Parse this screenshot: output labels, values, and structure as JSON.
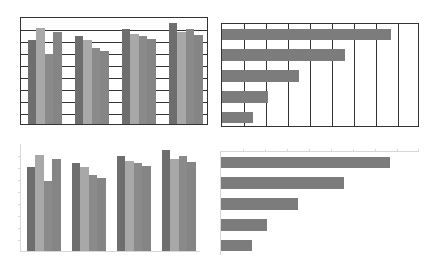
{
  "colors": {
    "dark": "#6e6e6e",
    "light": "#a8a8a8",
    "mid": "#8a8a8a",
    "mid2": "#858585",
    "hbar": "#7c7c7c",
    "grid_strong": "#333333",
    "grid_faint": "#d8d8d8"
  },
  "chart_data": [
    {
      "id": "top-left",
      "type": "bar",
      "title": "",
      "xlabel": "",
      "ylabel": "",
      "categories": [
        "",
        "",
        "",
        ""
      ],
      "series": [
        {
          "name": "Series 1",
          "values": [
            7.0,
            7.3,
            7.9,
            8.4
          ]
        },
        {
          "name": "Series 2",
          "values": [
            8.0,
            7.0,
            7.5,
            7.7
          ]
        },
        {
          "name": "Series 3",
          "values": [
            5.8,
            6.3,
            7.3,
            7.9
          ]
        },
        {
          "name": "Series 4",
          "values": [
            7.7,
            6.1,
            7.1,
            7.4
          ]
        }
      ],
      "ylim": [
        0,
        9
      ],
      "grid": "horizontal, dark, with plot border",
      "legend": "none",
      "tick_labels": "none"
    },
    {
      "id": "top-right",
      "type": "bar",
      "orientation": "horizontal",
      "title": "",
      "xlabel": "",
      "ylabel": "",
      "categories": [
        "",
        "",
        "",
        "",
        ""
      ],
      "values": [
        7.7,
        5.6,
        3.5,
        2.1,
        1.4
      ],
      "xlim": [
        0,
        9
      ],
      "grid": "vertical, dark, with plot border",
      "legend": "none",
      "tick_labels": "none"
    },
    {
      "id": "bottom-left",
      "type": "bar",
      "title": "",
      "xlabel": "",
      "ylabel": "",
      "categories": [
        "",
        "",
        "",
        ""
      ],
      "series": [
        {
          "name": "Series 1",
          "values": [
            7.0,
            7.3,
            7.9,
            8.4
          ]
        },
        {
          "name": "Series 2",
          "values": [
            8.0,
            7.0,
            7.5,
            7.7
          ]
        },
        {
          "name": "Series 3",
          "values": [
            5.8,
            6.3,
            7.3,
            7.9
          ]
        },
        {
          "name": "Series 4",
          "values": [
            7.7,
            6.1,
            7.1,
            7.4
          ]
        }
      ],
      "ylim": [
        0,
        9
      ],
      "grid": "off (faint axes only)",
      "legend": "none",
      "tick_labels": "none"
    },
    {
      "id": "bottom-right",
      "type": "bar",
      "orientation": "horizontal",
      "title": "",
      "xlabel": "",
      "ylabel": "",
      "categories": [
        "",
        "",
        "",
        "",
        ""
      ],
      "values": [
        7.7,
        5.6,
        3.5,
        2.1,
        1.4
      ],
      "xlim": [
        0,
        9
      ],
      "grid": "off (faint top axis with ticks)",
      "legend": "none",
      "tick_labels": "none"
    }
  ]
}
